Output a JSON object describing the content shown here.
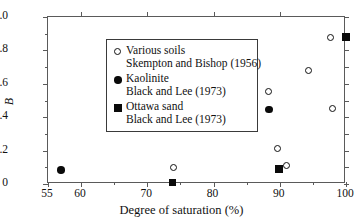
{
  "chart_data": {
    "type": "scatter",
    "title": "",
    "xlabel": "Degree of saturation (%)",
    "ylabel": "B",
    "xlim": [
      55,
      100
    ],
    "ylim": [
      0,
      1.0
    ],
    "grid": false,
    "legend_position": "upper-left-inside",
    "xticks": [
      55,
      60,
      65,
      70,
      75,
      80,
      85,
      90,
      95,
      100
    ],
    "xtick_labels": [
      "55",
      "60",
      "",
      "70",
      "",
      "80",
      "",
      "90",
      "",
      "100"
    ],
    "yticks": [
      0,
      0.1,
      0.2,
      0.3,
      0.4,
      0.5,
      0.6,
      0.7,
      0.8,
      0.9,
      1.0
    ],
    "ytick_labels": [
      "0",
      "",
      "0.2",
      "",
      "0.4",
      "",
      "0.6",
      "",
      "0.8",
      "",
      "1.0"
    ],
    "series": [
      {
        "name": "Various soils",
        "source": "Skempton and Bishop (1956)",
        "marker": "open-circle",
        "color": "#111111",
        "points": [
          {
            "x": 74.0,
            "y": 0.1
          },
          {
            "x": 80.0,
            "y": 0.34
          },
          {
            "x": 88.3,
            "y": 0.555
          },
          {
            "x": 89.7,
            "y": 0.21
          },
          {
            "x": 91.0,
            "y": 0.11
          },
          {
            "x": 94.3,
            "y": 0.68
          },
          {
            "x": 97.6,
            "y": 0.875
          },
          {
            "x": 97.9,
            "y": 0.455
          }
        ]
      },
      {
        "name": "Kaolinite",
        "source": "Black and Lee (1973)",
        "marker": "filled-circle",
        "color": "#0a0a0a",
        "points": [
          {
            "x": 57.0,
            "y": 0.085
          },
          {
            "x": 88.4,
            "y": 0.445
          }
        ]
      },
      {
        "name": "Ottawa sand",
        "source": "Black and Lee (1973)",
        "marker": "filled-square",
        "color": "#0a0a0a",
        "points": [
          {
            "x": 73.8,
            "y": 0.01
          },
          {
            "x": 89.9,
            "y": 0.09
          },
          {
            "x": 100.0,
            "y": 0.88
          }
        ]
      }
    ],
    "legend": [
      {
        "marker": "open-circle",
        "line1": "Various soils",
        "line2": "Skempton and Bishop (1956)"
      },
      {
        "marker": "filled-circle",
        "line1": "Kaolinite",
        "line2": "Black and Lee (1973)"
      },
      {
        "marker": "filled-square",
        "line1": "Ottawa sand",
        "line2": "Black and Lee (1973)"
      }
    ]
  }
}
